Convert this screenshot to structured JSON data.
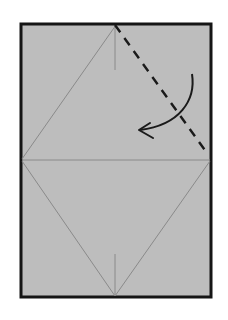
{
  "diagram": {
    "colors": {
      "background": "#ffffff",
      "paper": "#bdbdbd",
      "border": "#151515",
      "crease": "#8a8a8a",
      "dashed_fold": "#1a1a1a",
      "arrow": "#1a1a1a"
    },
    "paper_rect": {
      "x": 21,
      "y": 24,
      "width": 190,
      "height": 273
    },
    "creases": [
      {
        "name": "upper-left-diagonal",
        "x1": 116,
        "y1": 25,
        "x2": 22,
        "y2": 159
      },
      {
        "name": "horizontal-midline",
        "x1": 22,
        "y1": 160,
        "x2": 210,
        "y2": 160
      },
      {
        "name": "lower-left-diagonal",
        "x1": 22,
        "y1": 161,
        "x2": 115,
        "y2": 296
      },
      {
        "name": "lower-right-diagonal",
        "x1": 210,
        "y1": 161,
        "x2": 115,
        "y2": 296
      },
      {
        "name": "top-center-tick",
        "x1": 115,
        "y1": 26,
        "x2": 115,
        "y2": 70
      },
      {
        "name": "bottom-center-tick",
        "x1": 115,
        "y1": 254,
        "x2": 115,
        "y2": 296
      }
    ],
    "fold_line": {
      "style": "dashed",
      "x1": 115,
      "y1": 25,
      "x2": 207,
      "y2": 153
    },
    "arrow": {
      "type": "valley-fold-arrow",
      "path": "M192 74 C 196 100, 180 125, 140 130",
      "head": "M150 123 L139 130 L153 138"
    }
  }
}
